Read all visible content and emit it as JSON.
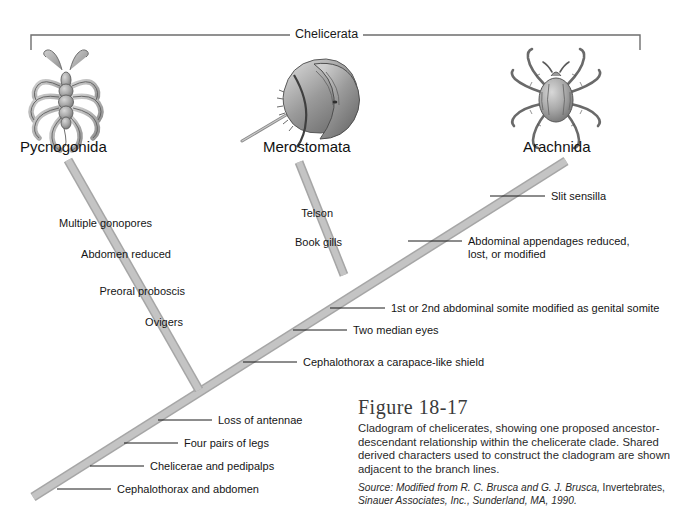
{
  "figure": {
    "clade_bracket_label": "Chelicerata",
    "title": "Figure 18-17",
    "caption": "Cladogram of chelicerates, showing one proposed ancestor-descendant relationship within the chelicerate clade. Shared derived characters used to construct the cladogram are shown adjacent to the branch lines.",
    "source_prefix": "Source: Modified from R. C. Brusca and G. J. Brusca,",
    "source_work": "Invertebrates,",
    "source_publisher": "Sinauer Associates, Inc., Sunderland, MA, 1990."
  },
  "colors": {
    "branch": "#bcbcbc",
    "branch_edge": "#a2a2a2",
    "bracket": "#6e6e6e",
    "leader": "#1a1a1a",
    "text": "#151515",
    "caption_title": "#3b3b3b"
  },
  "taxa": [
    {
      "name": "Pycnogonida",
      "icon": "sea-spider-illustration"
    },
    {
      "name": "Merostomata",
      "icon": "horseshoe-crab-illustration"
    },
    {
      "name": "Arachnida",
      "icon": "tick-illustration"
    }
  ],
  "characters": {
    "pycnogonida_branch": [
      "Multiple gonopores",
      "Abdomen reduced",
      "Preoral proboscis",
      "Ovigers"
    ],
    "merostomata_branch": [
      "Telson",
      "Book gills"
    ],
    "arachnida_branch": [
      "Slit sensilla",
      "Abdominal appendages reduced,",
      "lost, or modified"
    ],
    "main_trunk": [
      "1st or 2nd abdominal somite modified as genital somite",
      "Two median eyes",
      "Cephalothorax a carapace-like shield",
      "Loss of antennae",
      "Four pairs of legs",
      "Chelicerae and pedipalps",
      "Cephalothorax and abdomen"
    ]
  }
}
